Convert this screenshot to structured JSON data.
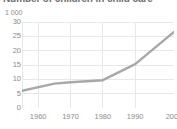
{
  "chart_data": {
    "type": "line",
    "title": "Number of children in child care",
    "unit_label": "1 000",
    "xlabel": "",
    "ylabel": "",
    "ylim": [
      0,
      30
    ],
    "xlim": [
      1955,
      2002
    ],
    "yticks": [
      30,
      25,
      20,
      15,
      10,
      5,
      0
    ],
    "ytick_labels": [
      "30",
      "25",
      "20",
      "15",
      "10",
      "5",
      "0"
    ],
    "xticks": [
      1960,
      1970,
      1980,
      1990,
      2002
    ],
    "xtick_labels": [
      "1960",
      "1970",
      "1980",
      "1990",
      "2002"
    ],
    "grid": true,
    "legend": null,
    "series": [
      {
        "name": "Children in child care",
        "color": "#a8a8a8",
        "x": [
          1955,
          1965,
          1970,
          1980,
          1990,
          2002
        ],
        "values": [
          6.0,
          8.5,
          9.0,
          9.7,
          15.3,
          26.5
        ]
      }
    ]
  },
  "style": {
    "background": "#ffffff",
    "grid_color": "#e8e8e8",
    "axis_color": "#d0d0d0",
    "tick_text_color": "#8a8a8a",
    "title_color": "#6e6e6e",
    "line_color": "#a8a8a8"
  }
}
